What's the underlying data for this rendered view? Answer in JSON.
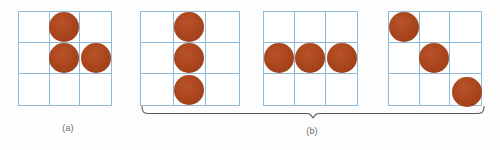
{
  "figure": {
    "background_color": "#fdfdfd",
    "grid_line_color": "#8fb9d8",
    "disc_color": "#a8441b",
    "grid_rows": 3,
    "grid_columns": 3,
    "labels": {
      "a": "(a)",
      "b": "(b)"
    },
    "panels": [
      {
        "id": "panel-a",
        "label": "(a)",
        "group": "a",
        "disc_count": 3,
        "arrangement": "corner",
        "discs": [
          {
            "row": 1,
            "col": 2
          },
          {
            "row": 2,
            "col": 2
          },
          {
            "row": 2,
            "col": 3
          }
        ]
      },
      {
        "id": "panel-b1",
        "label": "",
        "group": "b",
        "disc_count": 3,
        "arrangement": "vertical-line",
        "discs": [
          {
            "row": 1,
            "col": 2
          },
          {
            "row": 2,
            "col": 2
          },
          {
            "row": 3,
            "col": 2
          }
        ]
      },
      {
        "id": "panel-b2",
        "label": "",
        "group": "b",
        "disc_count": 3,
        "arrangement": "horizontal-line",
        "discs": [
          {
            "row": 2,
            "col": 1
          },
          {
            "row": 2,
            "col": 2
          },
          {
            "row": 2,
            "col": 3
          }
        ]
      },
      {
        "id": "panel-b3",
        "label": "",
        "group": "b",
        "disc_count": 3,
        "arrangement": "diagonal",
        "discs": [
          {
            "row": 1,
            "col": 1
          },
          {
            "row": 2,
            "col": 2
          },
          {
            "row": 3,
            "col": 3
          }
        ]
      }
    ]
  }
}
